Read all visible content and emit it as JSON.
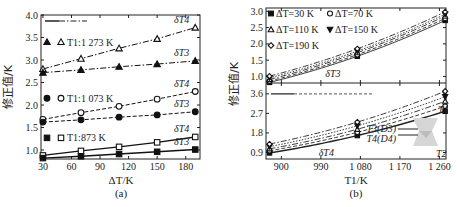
{
  "figure": {
    "panel_a_caption": "(a)",
    "panel_b_caption": "(b)"
  },
  "chart_data": [
    {
      "panel": "a",
      "type": "line",
      "title": "",
      "xlabel": "ΔT/K",
      "ylabel": "修正值/K",
      "xlim": [
        28,
        195
      ],
      "ylim": [
        0.8,
        4.0
      ],
      "xticks": [
        "30",
        "60",
        "90",
        "120",
        "150",
        "180"
      ],
      "yticks": [
        "1.0",
        "1.5",
        "2.0",
        "2.5",
        "3.0",
        "3.5",
        "4.0"
      ],
      "x": [
        30,
        70,
        110,
        150,
        190
      ],
      "grid": false,
      "legend_position": "inside-left",
      "legend": [
        {
          "label": "T1:1 273 K",
          "markers": [
            "filled-triangle",
            "open-triangle"
          ]
        },
        {
          "label": "T1:1 073 K",
          "markers": [
            "filled-circle",
            "open-circle"
          ]
        },
        {
          "label": "T1:873 K",
          "markers": [
            "filled-square",
            "open-square"
          ]
        }
      ],
      "series": [
        {
          "name": "T1=1273 K δT4",
          "marker": "open-triangle",
          "line": "dash-dot",
          "values": [
            2.8,
            3.03,
            3.26,
            3.47,
            3.72
          ]
        },
        {
          "name": "T1=1273 K δT3",
          "marker": "filled-triangle",
          "line": "dash-dot",
          "values": [
            2.72,
            2.78,
            2.85,
            2.91,
            2.98
          ]
        },
        {
          "name": "T1=1073 K δT4",
          "marker": "open-circle",
          "line": "dashed",
          "values": [
            1.68,
            1.83,
            1.97,
            2.13,
            2.3
          ]
        },
        {
          "name": "T1=1073 K δT3",
          "marker": "filled-circle",
          "line": "dashed",
          "values": [
            1.62,
            1.67,
            1.73,
            1.78,
            1.85
          ]
        },
        {
          "name": "T1=873 K δT4",
          "marker": "open-square",
          "line": "solid",
          "values": [
            0.88,
            0.98,
            1.07,
            1.17,
            1.29
          ]
        },
        {
          "name": "T1=873 K δT3",
          "marker": "filled-square",
          "line": "solid",
          "values": [
            0.82,
            0.86,
            0.91,
            0.96,
            1.01
          ]
        }
      ],
      "annotations": [
        "δT4",
        "δT3",
        "δT4",
        "δT3",
        "δT4",
        "δT3"
      ]
    },
    {
      "panel": "b-top",
      "type": "line",
      "xlabel": "T1/K",
      "ylabel": "修正值/K",
      "xlim": [
        865,
        1275
      ],
      "ylim": [
        0.8,
        3.1
      ],
      "yticks": [
        "1.0",
        "1.5",
        "2.0",
        "2.5",
        "3.0"
      ],
      "x": [
        873,
        1073,
        1273
      ],
      "annotation": "δT3",
      "legend": [
        {
          "label": "ΔT=30 K",
          "marker": "filled-square"
        },
        {
          "label": "ΔT=70 K",
          "marker": "open-circle"
        },
        {
          "label": "ΔT=110 K",
          "marker": "open-triangle"
        },
        {
          "label": "ΔT=150 K",
          "marker": "filled-down-triangle"
        },
        {
          "label": "ΔT=190 K",
          "marker": "open-diamond"
        }
      ],
      "series": [
        {
          "name": "ΔT=30 K",
          "values": [
            0.82,
            1.62,
            2.72
          ]
        },
        {
          "name": "ΔT=70 K",
          "values": [
            0.86,
            1.67,
            2.78
          ]
        },
        {
          "name": "ΔT=110 K",
          "values": [
            0.91,
            1.73,
            2.85
          ]
        },
        {
          "name": "ΔT=150 K",
          "values": [
            0.96,
            1.78,
            2.91
          ]
        },
        {
          "name": "ΔT=190 K",
          "values": [
            1.01,
            1.85,
            2.98
          ]
        }
      ]
    },
    {
      "panel": "b-bottom",
      "type": "line",
      "xlabel": "T1/K",
      "ylabel": "修正值/K",
      "xlim": [
        865,
        1275
      ],
      "ylim": [
        0.6,
        4.1
      ],
      "xticks": [
        "900",
        "990",
        "1 080",
        "1 170",
        "1 260"
      ],
      "yticks": [
        "0.9",
        "1.8",
        "2.7",
        "3.6"
      ],
      "x": [
        873,
        1073,
        1273
      ],
      "annotation": "δT4",
      "inset_labels": [
        "T1",
        "T3(D3)",
        "T4(D4)",
        "T2"
      ],
      "series": [
        {
          "name": "ΔT=30 K",
          "values": [
            0.88,
            1.68,
            2.8
          ]
        },
        {
          "name": "ΔT=70 K",
          "values": [
            0.98,
            1.83,
            3.03
          ]
        },
        {
          "name": "ΔT=110 K",
          "values": [
            1.07,
            1.97,
            3.26
          ]
        },
        {
          "name": "ΔT=150 K",
          "values": [
            1.17,
            2.13,
            3.47
          ]
        },
        {
          "name": "ΔT=190 K",
          "values": [
            1.29,
            2.3,
            3.72
          ]
        }
      ]
    }
  ]
}
